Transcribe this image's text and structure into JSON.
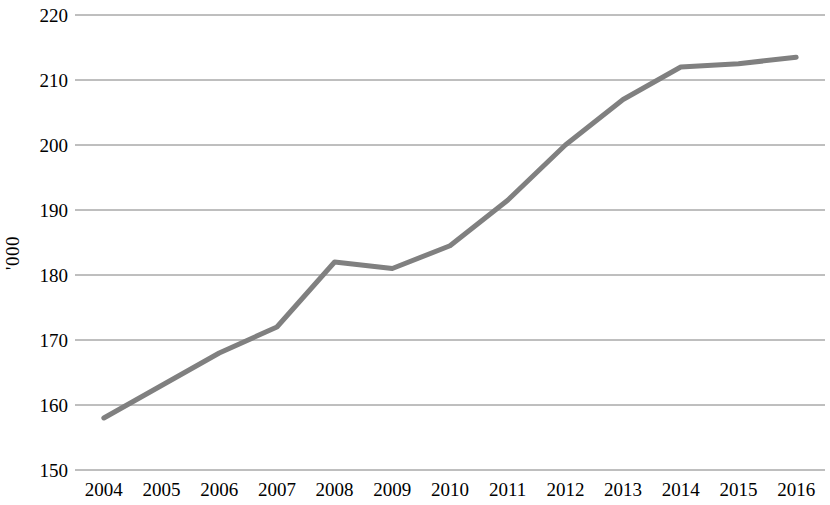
{
  "chart_data": {
    "type": "line",
    "title": "",
    "subtitle": "",
    "xlabel": "",
    "ylabel": "'000",
    "categories": [
      "2004",
      "2005",
      "2006",
      "2007",
      "2008",
      "2009",
      "2010",
      "2011",
      "2012",
      "2013",
      "2014",
      "2015",
      "2016"
    ],
    "series": [
      {
        "name": "",
        "color": "#808080",
        "values": [
          158,
          163,
          168,
          172,
          182,
          181,
          184.5,
          191.5,
          200,
          207,
          212,
          212.5,
          213.5
        ]
      }
    ],
    "ylim": [
      150,
      220
    ],
    "ytick_step": 10,
    "yticks": [
      220,
      210,
      200,
      190,
      180,
      170,
      160,
      150
    ],
    "xticks": [
      "2004",
      "2005",
      "2006",
      "2007",
      "2008",
      "2009",
      "2010",
      "2011",
      "2012",
      "2013",
      "2014",
      "2015",
      "2016"
    ],
    "grid": "horizontal",
    "gridline_color": "#7f7f7f",
    "legend": "none",
    "background": "#ffffff"
  }
}
